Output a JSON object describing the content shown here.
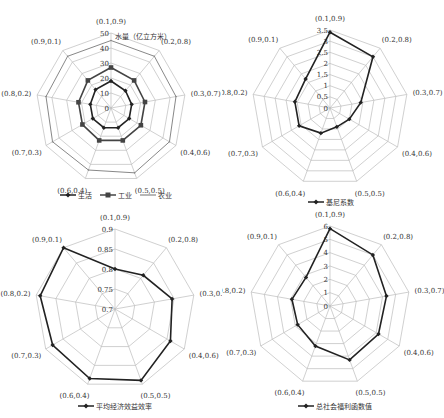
{
  "chart_data": [
    {
      "type": "radar",
      "title": "",
      "unit_label": "水量（亿立方米）",
      "categories": [
        "(0.1,0.9)",
        "(0.2,0.8)",
        "(0.3,0.7)",
        "(0.4,0.6)",
        "(0.5,0.5)",
        "(0.6,0.4)",
        "(0.7,0.3)",
        "(0.8,0.2)",
        "(0.9,0.1)"
      ],
      "ticks": [
        "0",
        "10",
        "20",
        "30",
        "40",
        "50"
      ],
      "range": [
        0,
        50
      ],
      "series": [
        {
          "name": "生活",
          "marker": "diamond",
          "color": "#222222",
          "values": [
            18,
            15,
            14,
            14,
            14,
            14,
            14,
            14,
            16
          ]
        },
        {
          "name": "工业",
          "marker": "square",
          "color": "#444444",
          "values": [
            27,
            24,
            23,
            23,
            23,
            23,
            22,
            22,
            24
          ]
        },
        {
          "name": "农业",
          "marker": "line",
          "color": "#888888",
          "values": [
            45,
            45,
            44,
            45,
            46,
            44,
            45,
            44,
            45
          ]
        }
      ],
      "legend_position": "bottom"
    },
    {
      "type": "radar",
      "title": "",
      "categories": [
        "(0.1,0.9)",
        "(0.2,0.8)",
        "(0.3,0.7)",
        "(0.4,0.6)",
        "(0.5,0.5)",
        "(0.6,0.4)",
        "(0.7,0.3)",
        "(0.8,0.2)",
        "(0.9,0.1)"
      ],
      "ticks": [
        "0",
        "0.5",
        "1",
        "1.5",
        "2",
        "2.5",
        "3",
        "3.5"
      ],
      "range": [
        0,
        3.5
      ],
      "series": [
        {
          "name": "基尼系数",
          "marker": "diamond",
          "color": "#222222",
          "values": [
            3.4,
            3.0,
            1.4,
            1.0,
            0.9,
            1.2,
            1.6,
            1.6,
            1.7
          ]
        }
      ],
      "legend_position": "bottom"
    },
    {
      "type": "radar",
      "title": "",
      "categories": [
        "(0.1,0.9)",
        "(0.2,0.8)",
        "(0.3,0.7)",
        "(0.4,0.6)",
        "(0.5,0.5)",
        "(0.6,0.4)",
        "(0.7,0.3)",
        "(0.8,0.2)",
        "(0.9,0.1)"
      ],
      "ticks": [
        "0.7",
        "0.75",
        "0.8",
        "0.85",
        "0.9"
      ],
      "range": [
        0.7,
        0.9
      ],
      "series": [
        {
          "name": "平均经济效益效率",
          "marker": "diamond",
          "color": "#222222",
          "values": [
            0.8,
            0.81,
            0.845,
            0.86,
            0.89,
            0.885,
            0.88,
            0.89,
            0.9
          ]
        }
      ],
      "legend_position": "bottom"
    },
    {
      "type": "radar",
      "title": "",
      "categories": [
        "(0.1,0.9)",
        "(0.2,0.8)",
        "(0.3,0.7)",
        "(0.4,0.6)",
        "(0.5,0.5)",
        "(0.6,0.4)",
        "(0.7,0.3)",
        "(0.8,0.2)",
        "(0.9,0.1)"
      ],
      "ticks": [
        "0",
        "1",
        "2",
        "3",
        "4",
        "5",
        "6"
      ],
      "range": [
        0,
        6
      ],
      "series": [
        {
          "name": "总社会福利函数值",
          "marker": "diamond",
          "color": "#222222",
          "values": [
            5.8,
            5.0,
            4.3,
            4.2,
            4.3,
            3.2,
            2.8,
            2.9,
            2.8
          ]
        }
      ],
      "legend_position": "bottom"
    }
  ]
}
